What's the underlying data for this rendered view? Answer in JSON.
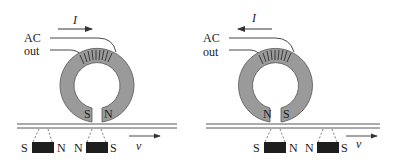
{
  "figure": {
    "panels": [
      {
        "id": "left",
        "current_label": "I",
        "current_direction": "right",
        "output_label_line1": "AC",
        "output_label_line2": "out",
        "gap_pole_left": "S",
        "gap_pole_right": "N",
        "magnet1_left": "S",
        "magnet1_right": "N",
        "magnet2_left": "N",
        "magnet2_right": "S",
        "velocity_label": "v"
      },
      {
        "id": "right",
        "current_label": "I",
        "current_direction": "left",
        "output_label_line1": "AC",
        "output_label_line2": "out",
        "gap_pole_left": "N",
        "gap_pole_right": "S",
        "magnet1_left": "S",
        "magnet1_right": "N",
        "magnet2_left": "N",
        "magnet2_right": "S",
        "velocity_label": "v"
      }
    ],
    "colors": {
      "core": "#9a9a9a",
      "magnet": "#1e1e1e",
      "line": "#333333"
    }
  }
}
